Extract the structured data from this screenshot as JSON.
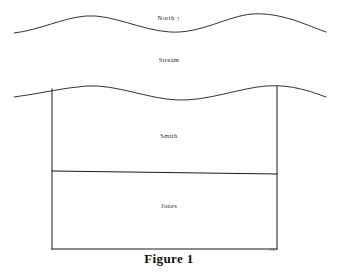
{
  "figure": {
    "caption": "Figure 1",
    "background_color": "#ffffff",
    "ink_color": "#1a1a1a",
    "width": 338,
    "height": 275
  },
  "labels": {
    "north": "North",
    "north_arrow_glyph": "↑",
    "stream": "Stream",
    "upper_parcel": "Smith",
    "lower_parcel": "Jones"
  },
  "artifact": {
    "text": "1984"
  },
  "diagram": {
    "type": "survey-sketch",
    "features": [
      {
        "name": "stream-north-bank",
        "kind": "wavy-line",
        "path": "M 14 33 C 40 30, 62 18, 86 16 C 112 14, 140 30, 170 32 C 200 34, 228 16, 252 14 C 282 12, 308 26, 326 32"
      },
      {
        "name": "stream-south-bank",
        "kind": "wavy-line",
        "path": "M 14 97 C 38 94, 62 88, 86 86 C 116 84, 148 99, 178 100 C 208 101, 240 88, 266 86 C 292 84, 312 92, 326 97"
      },
      {
        "name": "parcel-left-boundary",
        "kind": "line",
        "path": "M 52 89 L 52 249"
      },
      {
        "name": "parcel-right-boundary",
        "kind": "line",
        "path": "M 277 86 L 277 249"
      },
      {
        "name": "parcel-divider",
        "kind": "line",
        "path": "M 52 171 L 277 174"
      },
      {
        "name": "parcel-south-boundary",
        "kind": "line",
        "path": "M 52 249 L 277 249"
      }
    ]
  }
}
